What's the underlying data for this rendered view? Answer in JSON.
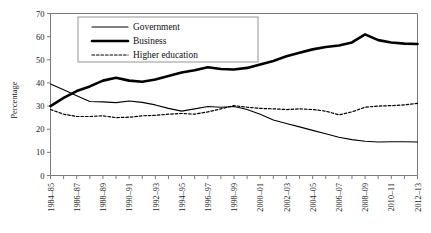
{
  "chart_data": {
    "type": "line",
    "title": "",
    "xlabel": "",
    "ylabel": "Percentage",
    "ylim": [
      0,
      70
    ],
    "ytick_step": 10,
    "yticks": [
      0,
      10,
      20,
      30,
      40,
      50,
      60,
      70
    ],
    "grid": false,
    "legend_position": "top-center",
    "categories": [
      "1984–85",
      "1985–86",
      "1986–87",
      "1987–88",
      "1988–89",
      "1989–90",
      "1990–91",
      "1991–92",
      "1992–93",
      "1993–94",
      "1994–95",
      "1995–96",
      "1996–97",
      "1997–98",
      "1998–99",
      "1999–2000",
      "2000–01",
      "2001–02",
      "2002–03",
      "2003–04",
      "2004–05",
      "2005–06",
      "2006–07",
      "2007–08",
      "2008–09",
      "2009–10",
      "2010–11",
      "2011–12",
      "2012–13"
    ],
    "xtick_labels": [
      "1984–85",
      "1986–87",
      "1988–89",
      "1990–91",
      "1992–93",
      "1994–95",
      "1996–97",
      "1998–99",
      "2000–01",
      "2002–03",
      "2004–05",
      "2006–07",
      "2008–09",
      "2010–11",
      "2012–13"
    ],
    "xtick_indices": [
      0,
      2,
      4,
      6,
      8,
      10,
      12,
      14,
      16,
      18,
      20,
      22,
      24,
      26,
      28
    ],
    "series": [
      {
        "name": "Government",
        "style": "thin-solid",
        "color": "#000000",
        "values": [
          39.5,
          37.0,
          34.5,
          32.0,
          31.8,
          31.5,
          32.2,
          31.6,
          30.5,
          29.0,
          27.8,
          28.8,
          29.8,
          29.5,
          29.8,
          28.5,
          26.5,
          24.0,
          22.5,
          21.0,
          19.5,
          18.0,
          16.5,
          15.5,
          14.8,
          14.5,
          14.6,
          14.6,
          14.5
        ]
      },
      {
        "name": "Business",
        "style": "thick-solid",
        "color": "#000000",
        "values": [
          30.0,
          33.5,
          36.5,
          38.5,
          41.0,
          42.2,
          41.0,
          40.5,
          41.5,
          43.0,
          44.5,
          45.5,
          46.8,
          46.0,
          45.8,
          46.5,
          48.0,
          49.5,
          51.5,
          53.0,
          54.5,
          55.5,
          56.2,
          57.5,
          61.0,
          58.5,
          57.5,
          57.0,
          56.8
        ]
      },
      {
        "name": "Higher education",
        "style": "dashed",
        "color": "#000000",
        "values": [
          28.5,
          26.5,
          25.5,
          25.5,
          25.8,
          25.0,
          25.2,
          25.8,
          26.0,
          26.5,
          26.8,
          26.5,
          27.5,
          28.8,
          30.2,
          29.5,
          29.0,
          28.8,
          28.5,
          28.8,
          28.5,
          27.8,
          26.2,
          27.5,
          29.5,
          30.0,
          30.2,
          30.5,
          31.2
        ]
      }
    ],
    "legend": [
      {
        "label": "Government",
        "style": "thin-solid"
      },
      {
        "label": "Business",
        "style": "thick-solid"
      },
      {
        "label": "Higher education",
        "style": "dashed"
      }
    ]
  }
}
